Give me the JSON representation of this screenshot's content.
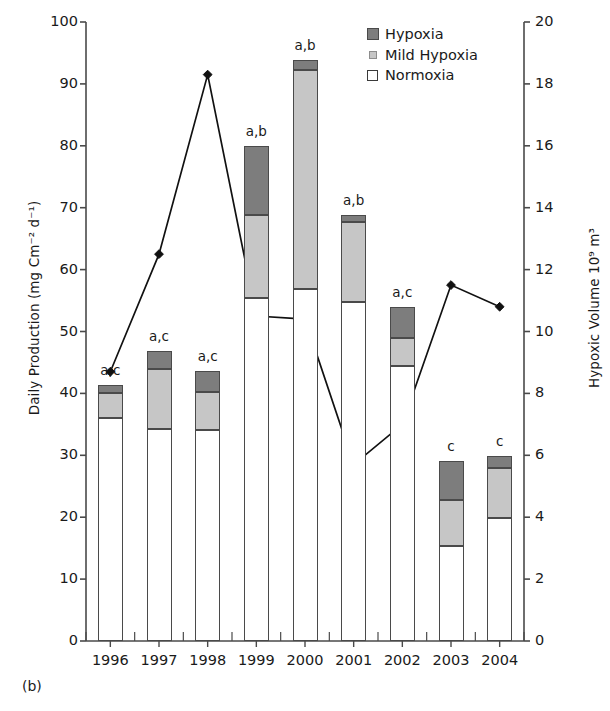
{
  "panel": {
    "label": "(b)"
  },
  "legend": {
    "position": "top-right",
    "items": [
      {
        "name": "Hypoxia",
        "color": "#7d7d7d",
        "icon": "filled-square-dark"
      },
      {
        "name": "Mild Hypoxia",
        "color": "#c6c6c6",
        "icon": "filled-square-light"
      },
      {
        "name": "Normoxia",
        "color": "#ffffff",
        "icon": "open-square"
      }
    ]
  },
  "chart_data": {
    "type": "bar",
    "title": "",
    "xlabel": "",
    "ylabel": "Daily Production (mg Cm⁻² d⁻¹)",
    "y2label": "Hypoxic Volume 10⁹ m³",
    "categories": [
      "1996",
      "1997",
      "1998",
      "1999",
      "2000",
      "2001",
      "2002",
      "2003",
      "2004"
    ],
    "ylim": [
      0,
      100
    ],
    "yticks": [
      0,
      10,
      20,
      30,
      40,
      50,
      60,
      70,
      80,
      90,
      100
    ],
    "y2lim": [
      0,
      20
    ],
    "y2ticks": [
      0,
      2,
      4,
      6,
      8,
      10,
      12,
      14,
      16,
      18,
      20
    ],
    "grid": false,
    "stacked": true,
    "series": [
      {
        "name": "Normoxia",
        "color": "#ffffff",
        "axis": "left",
        "values": [
          36.0,
          34.2,
          34.1,
          55.4,
          56.8,
          54.8,
          44.4,
          15.3,
          19.9
        ]
      },
      {
        "name": "Mild Hypoxia",
        "color": "#c6c6c6",
        "axis": "left",
        "values": [
          4.0,
          9.8,
          6.1,
          13.5,
          35.5,
          12.9,
          4.6,
          7.5,
          8.0
        ]
      },
      {
        "name": "Hypoxia",
        "color": "#7d7d7d",
        "axis": "left",
        "values": [
          1.4,
          2.9,
          3.4,
          11.1,
          1.6,
          1.1,
          5.0,
          6.2,
          2.0
        ]
      }
    ],
    "totals": [
      41.4,
      46.9,
      43.6,
      80.0,
      93.9,
      68.8,
      54.0,
      29.0,
      29.9
    ],
    "line_series": {
      "name": "Hypoxic Volume",
      "axis": "right",
      "marker": "diamond",
      "color": "#111111",
      "x": [
        "1996",
        "1997",
        "1998",
        "1999",
        "2000",
        "2001",
        "2002",
        "2003",
        "2004"
      ],
      "values": [
        8.7,
        12.5,
        18.3,
        10.5,
        10.4,
        5.7,
        7.0,
        11.5,
        10.8
      ]
    },
    "annotations": [
      {
        "category": "1996",
        "text": "a,c"
      },
      {
        "category": "1997",
        "text": "a,c"
      },
      {
        "category": "1998",
        "text": "a,c"
      },
      {
        "category": "1999",
        "text": "a,b"
      },
      {
        "category": "2000",
        "text": "a,b"
      },
      {
        "category": "2001",
        "text": "a,b"
      },
      {
        "category": "2002",
        "text": "a,c"
      },
      {
        "category": "2003",
        "text": "c"
      },
      {
        "category": "2004",
        "text": "c"
      }
    ]
  }
}
